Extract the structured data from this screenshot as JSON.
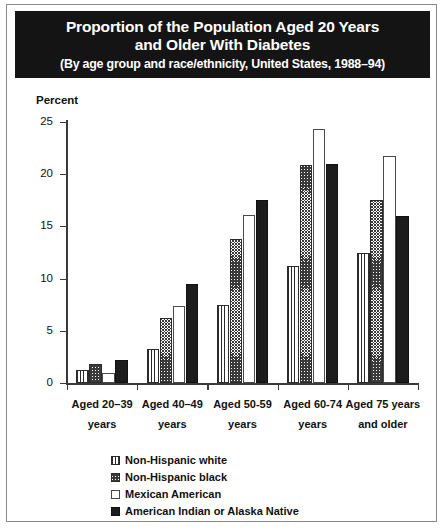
{
  "figure": {
    "title_line1": "Proportion of the Population Aged 20 Years",
    "title_line2": "and Older With Diabetes",
    "title_line3": "(By age group and race/ethnicity, United States, 1988–94)",
    "banner_color": "#141414",
    "banner_text_color": "#ffffff",
    "background_color": "#ffffff",
    "border_color": "#8a8a8a"
  },
  "chart_data": {
    "type": "bar",
    "title": "Proportion of the Population Aged 20 Years and Older With Diabetes",
    "subtitle": "(By age group and race/ethnicity, United States, 1988–94)",
    "xlabel": "",
    "ylabel": "Percent",
    "ylim": [
      0,
      25
    ],
    "yticks": [
      0,
      5,
      10,
      15,
      20,
      25
    ],
    "ytick_labels": [
      "0",
      "5",
      "10",
      "15",
      "20",
      "25"
    ],
    "grid": false,
    "legend_position": "bottom",
    "categories": [
      "Aged 20–39 years",
      "Aged 40–49 years",
      "Aged 50-59 years",
      "Aged 60-74 years",
      "Aged 75 years and older"
    ],
    "category_lines": [
      [
        "Aged 20–39",
        "years"
      ],
      [
        "Aged 40–49",
        "years"
      ],
      [
        "Aged 50-59",
        "years"
      ],
      [
        "Aged 60-74",
        "years"
      ],
      [
        "Aged 75 years",
        "and older"
      ]
    ],
    "series": [
      {
        "name": "Non-Hispanic white",
        "pattern": "vertical-stripes",
        "values": [
          1.2,
          3.3,
          7.5,
          11.2,
          12.5
        ]
      },
      {
        "name": "Non-Hispanic black",
        "pattern": "diagonal-hatch",
        "values": [
          1.8,
          6.2,
          13.8,
          20.9,
          17.5
        ]
      },
      {
        "name": "Mexican American",
        "pattern": "white-open",
        "values": [
          1.0,
          7.4,
          16.1,
          24.3,
          21.7
        ]
      },
      {
        "name": "American Indian or Alaska Native",
        "pattern": "solid-black",
        "values": [
          2.2,
          9.5,
          17.5,
          21.0,
          16.0
        ]
      }
    ]
  },
  "legend": {
    "items": [
      {
        "label": "Non-Hispanic white",
        "pattern": "vertical-stripes"
      },
      {
        "label": "Non-Hispanic black",
        "pattern": "diagonal-hatch"
      },
      {
        "label": "Mexican American",
        "pattern": "white-open"
      },
      {
        "label": "American Indian or Alaska Native",
        "pattern": "solid-black"
      }
    ]
  }
}
